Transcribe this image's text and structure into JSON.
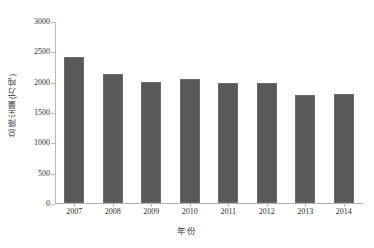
{
  "chart_data": {
    "type": "bar",
    "title": "",
    "subtitle": "",
    "xlabel": "年份",
    "ylabel": "总降尘量(万吨)",
    "categories": [
      "2007",
      "2008",
      "2009",
      "2010",
      "2011",
      "2012",
      "2013",
      "2014"
    ],
    "values": [
      2400,
      2130,
      1990,
      2040,
      1985,
      1980,
      1780,
      1790
    ],
    "series": [
      {
        "name": "总降尘量",
        "values": [
          2400,
          2130,
          1990,
          2040,
          1985,
          1980,
          1780,
          1790
        ]
      }
    ],
    "ylim": [
      0,
      3000
    ],
    "y_ticks": [
      "0",
      "500",
      "1000",
      "1500",
      "2000",
      "2500",
      "3000"
    ],
    "y_tick_values": [
      0,
      500,
      1000,
      1500,
      2000,
      2500,
      3000
    ],
    "x_ticks": [
      "2007",
      "2008",
      "2009",
      "2010",
      "2011",
      "2012",
      "2013",
      "2014"
    ],
    "grid": false,
    "legend": null,
    "legend_position": "none",
    "annotations": [],
    "bar_color": "#595959",
    "axis_color": "#b8b8b8",
    "background_color": "#ffffff"
  }
}
